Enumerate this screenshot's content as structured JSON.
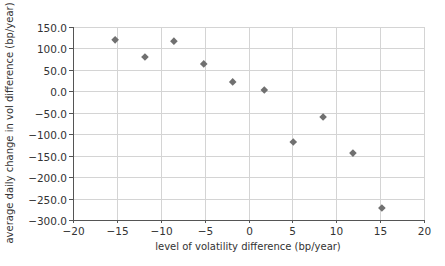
{
  "chart_data": {
    "type": "scatter",
    "title": "",
    "xlabel": "level of volatility difference (bp/year)",
    "ylabel": "average daily change in vol difference (bp/year)",
    "xlim": [
      -20,
      20
    ],
    "ylim": [
      -300,
      150
    ],
    "x_ticks": [
      -20,
      -15,
      -10,
      -5,
      0,
      5,
      10,
      15,
      20
    ],
    "x_tick_labels": [
      "−20",
      "−15",
      "−10",
      "−5",
      "0",
      "5",
      "10",
      "15",
      "20"
    ],
    "y_ticks": [
      150,
      100,
      50,
      0,
      -50,
      -100,
      -150,
      -200,
      -250,
      -300
    ],
    "y_tick_labels": [
      "150.0",
      "100.0",
      "50.0",
      "0.0",
      "−50.0",
      "−100.0",
      "−150.0",
      "−200.0",
      "−250.0",
      "−300.0"
    ],
    "grid": true,
    "legend": null,
    "marker": "diamond",
    "marker_color": "#707070",
    "grid_color": "#d4d4d4",
    "axis_color": "#555555",
    "series": [
      {
        "name": "observations",
        "x": [
          -15.2,
          -11.8,
          -8.5,
          -5.1,
          -1.8,
          1.8,
          5.1,
          8.5,
          11.9,
          15.2
        ],
        "y": [
          120,
          80,
          117,
          64,
          22,
          3,
          -118,
          -60,
          -144,
          -272
        ]
      }
    ]
  }
}
